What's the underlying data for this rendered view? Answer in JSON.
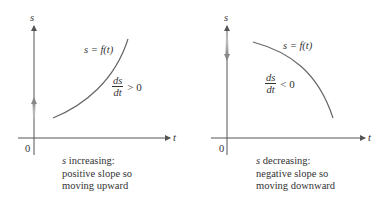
{
  "panels": [
    {
      "id": "left",
      "axis_y_label": "s",
      "axis_x_label": "t",
      "origin_label": "0",
      "curve_label": "s = f(t)",
      "derivative": {
        "numerator": "ds",
        "denominator": "dt",
        "relation": "> 0"
      },
      "caption": [
        "s increasing:",
        "positive slope so",
        "moving upward"
      ],
      "arrow_direction": "up"
    },
    {
      "id": "right",
      "axis_y_label": "s",
      "axis_x_label": "t",
      "origin_label": "0",
      "curve_label": "s = f(t)",
      "derivative": {
        "numerator": "ds",
        "denominator": "dt",
        "relation": "< 0"
      },
      "caption": [
        "s decreasing:",
        "negative slope so",
        "moving downward"
      ],
      "arrow_direction": "down"
    }
  ],
  "colors": {
    "axis": "#555555",
    "curve": "#666666",
    "arrow": "#8a8a8a",
    "text": "#333333"
  }
}
